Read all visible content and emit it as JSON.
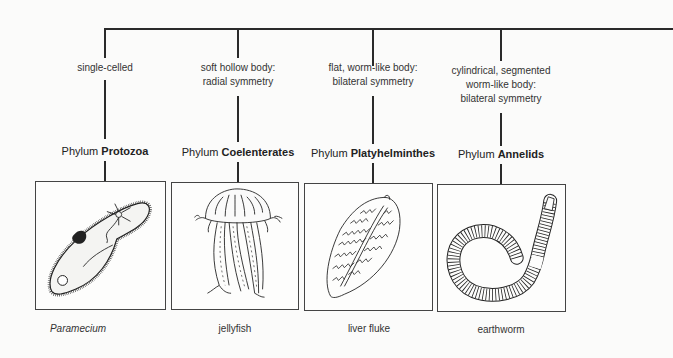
{
  "diagram": {
    "type": "classification-tree",
    "trunk": {
      "extends_right": true
    },
    "columns": [
      {
        "characteristic_lines": [
          "single-celled"
        ],
        "phylum_prefix": "Phylum",
        "phylum_name": "Protozoa",
        "illustration": "paramecium-drawing",
        "example": "Paramecium",
        "example_italic": true
      },
      {
        "characteristic_lines": [
          "soft hollow body:",
          "radial symmetry"
        ],
        "phylum_prefix": "Phylum",
        "phylum_name": "Coelenterates",
        "illustration": "jellyfish-drawing",
        "example": "jellyfish",
        "example_italic": false
      },
      {
        "characteristic_lines": [
          "flat, worm-like body:",
          "bilateral symmetry"
        ],
        "phylum_prefix": "Phylum",
        "phylum_name": "Platyhelminthes",
        "illustration": "liver-fluke-drawing",
        "example": "liver fluke",
        "example_italic": false
      },
      {
        "characteristic_lines": [
          "cylindrical, segmented",
          "worm-like body:",
          "bilateral symmetry"
        ],
        "phylum_prefix": "Phylum",
        "phylum_name": "Annelids",
        "illustration": "earthworm-drawing",
        "example": "earthworm",
        "example_italic": false
      }
    ],
    "colors": {
      "line": "#2a2a2a",
      "background": "#fbfbfa",
      "text": "#222222"
    }
  }
}
